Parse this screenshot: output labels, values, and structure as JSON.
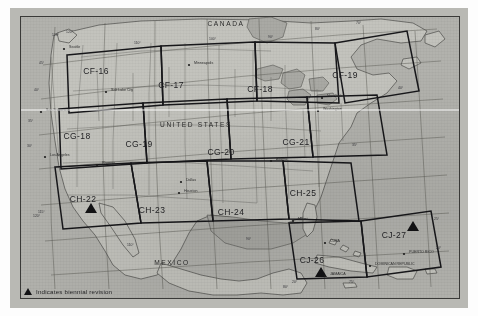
{
  "map": {
    "title": "Index of 1:500,000 scale aeronautical chart coverage",
    "background_color": "#b5b5b0",
    "ink_color": "#17171a",
    "cells": [
      {
        "id": "CF-16",
        "label": "CF-16",
        "x": 96,
        "y": 74,
        "biennial": false
      },
      {
        "id": "CF-17",
        "label": "CF-17",
        "x": 171,
        "y": 88,
        "biennial": false
      },
      {
        "id": "CF-18",
        "label": "CF-18",
        "x": 260,
        "y": 92,
        "biennial": false
      },
      {
        "id": "CF-19",
        "label": "CF-19",
        "x": 345,
        "y": 78,
        "biennial": false
      },
      {
        "id": "CG-18",
        "label": "CG-18",
        "x": 77,
        "y": 139,
        "biennial": false
      },
      {
        "id": "CG-19",
        "label": "CG-19",
        "x": 139,
        "y": 147,
        "biennial": false
      },
      {
        "id": "CG-20",
        "label": "CG-20",
        "x": 221,
        "y": 155,
        "biennial": false
      },
      {
        "id": "CG-21",
        "label": "CG-21",
        "x": 296,
        "y": 145,
        "biennial": false
      },
      {
        "id": "CH-22",
        "label": "CH-22",
        "x": 83,
        "y": 202,
        "biennial": true
      },
      {
        "id": "CH-23",
        "label": "CH-23",
        "x": 152,
        "y": 213,
        "biennial": false
      },
      {
        "id": "CH-24",
        "label": "CH-24",
        "x": 231,
        "y": 215,
        "biennial": false
      },
      {
        "id": "CH-25",
        "label": "CH-25",
        "x": 303,
        "y": 196,
        "biennial": false
      },
      {
        "id": "CJ-26",
        "label": "CJ-26",
        "x": 312,
        "y": 263,
        "biennial": true
      },
      {
        "id": "CJ-27",
        "label": "CJ-27",
        "x": 394,
        "y": 238,
        "biennial": true
      }
    ],
    "countries": [
      {
        "name": "CANADA",
        "x": 226,
        "y": 26
      },
      {
        "name": "UNITED STATES",
        "x": 196,
        "y": 127
      },
      {
        "name": "MEXICO",
        "x": 172,
        "y": 265
      }
    ],
    "places": [
      {
        "name": "Seattle",
        "x": 69,
        "y": 48
      },
      {
        "name": "Minneapolis",
        "x": 194,
        "y": 64
      },
      {
        "name": "Salt Lake City",
        "x": 111,
        "y": 91
      },
      {
        "name": "San Francisco",
        "x": 46,
        "y": 111
      },
      {
        "name": "New York",
        "x": 327,
        "y": 97
      },
      {
        "name": "Washington",
        "x": 323,
        "y": 110
      },
      {
        "name": "Los Angeles",
        "x": 50,
        "y": 156
      },
      {
        "name": "Phoenix",
        "x": 102,
        "y": 164
      },
      {
        "name": "Atlanta",
        "x": 276,
        "y": 160
      },
      {
        "name": "Dallas",
        "x": 186,
        "y": 181
      },
      {
        "name": "Houston",
        "x": 184,
        "y": 192
      },
      {
        "name": "Miami",
        "x": 298,
        "y": 220
      },
      {
        "name": "CUBA",
        "x": 330,
        "y": 242
      },
      {
        "name": "JAMAICA",
        "x": 330,
        "y": 275
      },
      {
        "name": "DOMINICAN REPUBLIC",
        "x": 375,
        "y": 265
      },
      {
        "name": "PUERTO RICO",
        "x": 409,
        "y": 253
      }
    ],
    "graticule_labels": [
      {
        "text": "125°",
        "x": 52,
        "y": 36
      },
      {
        "text": "120°",
        "x": 66,
        "y": 33
      },
      {
        "text": "110°",
        "x": 134,
        "y": 44
      },
      {
        "text": "100°",
        "x": 209,
        "y": 40
      },
      {
        "text": "90°",
        "x": 268,
        "y": 38
      },
      {
        "text": "80°",
        "x": 315,
        "y": 30
      },
      {
        "text": "70°",
        "x": 356,
        "y": 24
      },
      {
        "text": "45°",
        "x": 39,
        "y": 64
      },
      {
        "text": "40°",
        "x": 34,
        "y": 91
      },
      {
        "text": "40°",
        "x": 398,
        "y": 89
      },
      {
        "text": "35°",
        "x": 28,
        "y": 122
      },
      {
        "text": "35°",
        "x": 352,
        "y": 146
      },
      {
        "text": "30°",
        "x": 27,
        "y": 147
      },
      {
        "text": "120°",
        "x": 33,
        "y": 217
      },
      {
        "text": "115°",
        "x": 38,
        "y": 213
      },
      {
        "text": "110°",
        "x": 127,
        "y": 246
      },
      {
        "text": "90°",
        "x": 246,
        "y": 240
      },
      {
        "text": "25°",
        "x": 434,
        "y": 220
      },
      {
        "text": "20°",
        "x": 436,
        "y": 249
      },
      {
        "text": "80°",
        "x": 283,
        "y": 288
      },
      {
        "text": "75°",
        "x": 349,
        "y": 283
      },
      {
        "text": "20°",
        "x": 292,
        "y": 283
      }
    ]
  },
  "legend": {
    "marker_icon": "triangle-icon",
    "text": "Indicates biennial revision"
  }
}
